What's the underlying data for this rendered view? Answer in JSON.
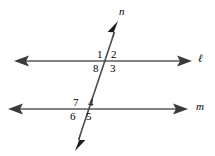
{
  "figure": {
    "background_color": "#ffffff",
    "stroke_color": "#5a5a5a",
    "transversal_color": "#4d4d4d",
    "text_color": "#000000"
  },
  "lines": [
    {
      "id": "line-ell",
      "label": "ℓ",
      "kind": "horizontal",
      "label_x": 198,
      "label_y": 53,
      "y": 61,
      "x_start": 16,
      "x_end": 190,
      "arrows": "both"
    },
    {
      "id": "line-m",
      "label": "m",
      "kind": "horizontal",
      "label_x": 196,
      "label_y": 101,
      "y": 109,
      "x_start": 10,
      "x_end": 186,
      "arrows": "both"
    },
    {
      "id": "line-n",
      "label": "n",
      "kind": "transversal",
      "label_x": 119,
      "label_y": 6,
      "x_top": 118,
      "y_top": 22,
      "x_bottom": 75,
      "y_bottom": 150,
      "arrows": "both"
    }
  ],
  "intersections": [
    {
      "id": "upper",
      "x": 108,
      "y": 61
    },
    {
      "id": "lower",
      "x": 85,
      "y": 109
    }
  ],
  "angles": [
    {
      "id": "angle-1",
      "number": "1",
      "x": 97,
      "y": 49,
      "intersection": "upper",
      "position": "top-left"
    },
    {
      "id": "angle-2",
      "number": "2",
      "x": 111,
      "y": 49,
      "intersection": "upper",
      "position": "top-right"
    },
    {
      "id": "angle-3",
      "number": "3",
      "x": 110,
      "y": 63,
      "intersection": "upper",
      "position": "bottom-right"
    },
    {
      "id": "angle-8",
      "number": "8",
      "x": 93,
      "y": 63,
      "intersection": "upper",
      "position": "bottom-left"
    },
    {
      "id": "angle-7",
      "number": "7",
      "x": 73,
      "y": 97,
      "intersection": "lower",
      "position": "top-left"
    },
    {
      "id": "angle-4",
      "number": "4",
      "x": 88,
      "y": 97,
      "intersection": "lower",
      "position": "top-right"
    },
    {
      "id": "angle-5",
      "number": "5",
      "x": 86,
      "y": 111,
      "intersection": "lower",
      "position": "bottom-right"
    },
    {
      "id": "angle-6",
      "number": "6",
      "x": 70,
      "y": 111,
      "intersection": "lower",
      "position": "bottom-left"
    }
  ]
}
